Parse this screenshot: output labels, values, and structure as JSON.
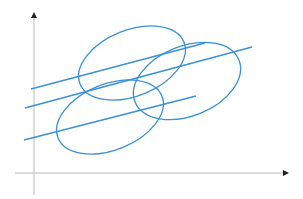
{
  "diagram": {
    "type": "scatter-ellipses",
    "colors": {
      "axis": "#bbbbbb",
      "arrow": "#222222",
      "shape": "#3d8fd6",
      "background": "#ffffff"
    },
    "axes": {
      "y": {
        "x": 34,
        "y_top": 12,
        "y_bottom": 195
      },
      "x": {
        "y": 173,
        "x_left": 15,
        "x_right": 289
      }
    },
    "ellipses": [
      {
        "name": "upper-left",
        "cx": 132,
        "cy": 63,
        "rx": 56,
        "ry": 33,
        "rotate": -22
      },
      {
        "name": "upper-right",
        "cx": 187,
        "cy": 81,
        "rx": 56,
        "ry": 35,
        "rotate": -22
      },
      {
        "name": "lower",
        "cx": 110,
        "cy": 117,
        "rx": 56,
        "ry": 33,
        "rotate": -22
      }
    ],
    "lines": [
      {
        "name": "line-top",
        "x1": 31,
        "y1": 89,
        "x2": 205,
        "y2": 43
      },
      {
        "name": "line-middle",
        "x1": 25,
        "y1": 108,
        "x2": 252,
        "y2": 47
      },
      {
        "name": "line-bottom",
        "x1": 24,
        "y1": 140,
        "x2": 196,
        "y2": 96
      }
    ]
  }
}
